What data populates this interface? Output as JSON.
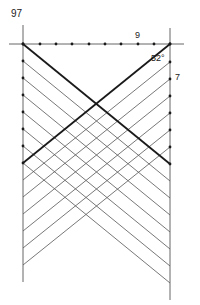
{
  "figure": {
    "number": "97",
    "labels": {
      "top_divisions": "9",
      "angle": "52°",
      "side_divisions": "7"
    }
  },
  "colors": {
    "background": "#ffffff",
    "thin_line": "#555555",
    "bold_line": "#1a1a1a",
    "frame_line": "#666666",
    "dot": "#1a1a1a"
  },
  "geometry": {
    "left_x": 23,
    "right_x": 170,
    "top_y": 44,
    "spacing_y": 17,
    "baseline": {
      "x1": 9,
      "x2": 184,
      "y": 44
    },
    "left_post": {
      "y1": 25,
      "y2": 282
    },
    "right_post": {
      "y1": 28,
      "y2": 300
    },
    "top_dots_x": [
      23,
      40,
      56,
      72,
      89,
      105,
      121,
      138,
      154,
      170
    ],
    "left_dots_y": [
      44,
      61,
      78,
      95,
      112,
      129,
      146,
      163
    ],
    "right_dots_y": [
      44,
      62,
      79,
      96,
      113,
      130,
      147,
      164
    ],
    "descending_lines": [
      {
        "y_left": 44,
        "y_right": 164,
        "bold": true
      },
      {
        "y_left": 61,
        "y_right": 181,
        "bold": false
      },
      {
        "y_left": 78,
        "y_right": 198,
        "bold": false
      },
      {
        "y_left": 95,
        "y_right": 215,
        "bold": false
      },
      {
        "y_left": 112,
        "y_right": 232,
        "bold": false
      },
      {
        "y_left": 129,
        "y_right": 249,
        "bold": false
      },
      {
        "y_left": 146,
        "y_right": 266,
        "bold": false
      },
      {
        "y_left": 163,
        "y_right": 283,
        "bold": false
      }
    ],
    "ascending_lines": [
      {
        "y_left": 163,
        "y_right": 44,
        "bold": true
      },
      {
        "y_left": 180,
        "y_right": 62,
        "bold": false
      },
      {
        "y_left": 197,
        "y_right": 79,
        "bold": false
      },
      {
        "y_left": 214,
        "y_right": 96,
        "bold": false
      },
      {
        "y_left": 231,
        "y_right": 113,
        "bold": false
      },
      {
        "y_left": 248,
        "y_right": 130,
        "bold": false
      },
      {
        "y_left": 265,
        "y_right": 147,
        "bold": false
      }
    ]
  }
}
